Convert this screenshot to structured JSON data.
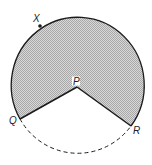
{
  "figure": {
    "type": "circle sector diagram",
    "colors": {
      "shade_light": "#d8d8d8",
      "shade_dark": "#a8a8a8",
      "stroke": "#1a1a1a",
      "background": "#ffffff"
    },
    "center": {
      "name": "P",
      "label": "P"
    },
    "points": [
      {
        "name": "X",
        "label": "X",
        "on": "circle"
      },
      {
        "name": "Q",
        "label": "Q",
        "on": "circle"
      },
      {
        "name": "R",
        "label": "R",
        "on": "circle"
      }
    ],
    "segments": [
      {
        "from": "P",
        "to": "Q",
        "style": "solid"
      },
      {
        "from": "P",
        "to": "R",
        "style": "solid"
      }
    ],
    "arcs": [
      {
        "from": "Q",
        "to": "R",
        "via": "X",
        "style": "solid",
        "region": "major sector shaded"
      },
      {
        "from": "Q",
        "to": "R",
        "style": "dashed",
        "region": "minor arc unshaded"
      }
    ]
  }
}
